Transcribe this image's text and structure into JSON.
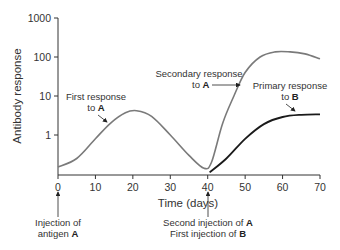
{
  "chart_data": {
    "type": "line",
    "title": "",
    "xlabel": "Time (days)",
    "ylabel": "Antibody response",
    "xlim": [
      0,
      70
    ],
    "ylim": [
      0.1,
      1000
    ],
    "yscale": "log",
    "grid": false,
    "x_ticks": [
      0,
      10,
      20,
      30,
      40,
      50,
      60,
      70
    ],
    "y_ticks": [
      1,
      10,
      100,
      1000
    ],
    "y_tick_labels": [
      "1",
      "10",
      "100",
      "1000"
    ],
    "series": [
      {
        "name": "Antibody response to A",
        "color": "#7a7a7a",
        "x": [
          0,
          5,
          10,
          14,
          18,
          21,
          25,
          30,
          35,
          39,
          41,
          44,
          47,
          50,
          54,
          58,
          62,
          66,
          70
        ],
        "values": [
          0.15,
          0.25,
          0.8,
          2,
          3.7,
          4.2,
          3,
          1,
          0.3,
          0.14,
          0.2,
          2,
          10,
          40,
          100,
          135,
          135,
          120,
          90
        ]
      },
      {
        "name": "Antibody response to B",
        "color": "#1a1a1a",
        "x": [
          40.5,
          45,
          50,
          55,
          60,
          65,
          70
        ],
        "values": [
          0.11,
          0.25,
          0.8,
          1.9,
          2.9,
          3.3,
          3.4
        ]
      }
    ],
    "annotations": [
      {
        "text": "First response to A",
        "line1": "First response",
        "line2_prefix": "to ",
        "line2_bold": "A",
        "x": 14,
        "y": 2
      },
      {
        "text": "Secondary response to A",
        "line1": "Secondary response",
        "line2_prefix": "to ",
        "line2_bold": "A",
        "x": 49,
        "y": 20
      },
      {
        "text": "Primary response to B",
        "line1": "Primary response",
        "line2_prefix": "to ",
        "line2_bold": "B",
        "x": 63,
        "y": 3.2
      },
      {
        "text": "Injection of antigen A",
        "line1": "Injection of",
        "line2_prefix": "antigen ",
        "line2_bold": "A",
        "x": 0
      },
      {
        "text": "Second injection of A / First injection of B",
        "line1_prefix": "Second injection of ",
        "line1_bold": "A",
        "line2_prefix": "First injection of ",
        "line2_bold": "B",
        "x": 40
      }
    ]
  }
}
